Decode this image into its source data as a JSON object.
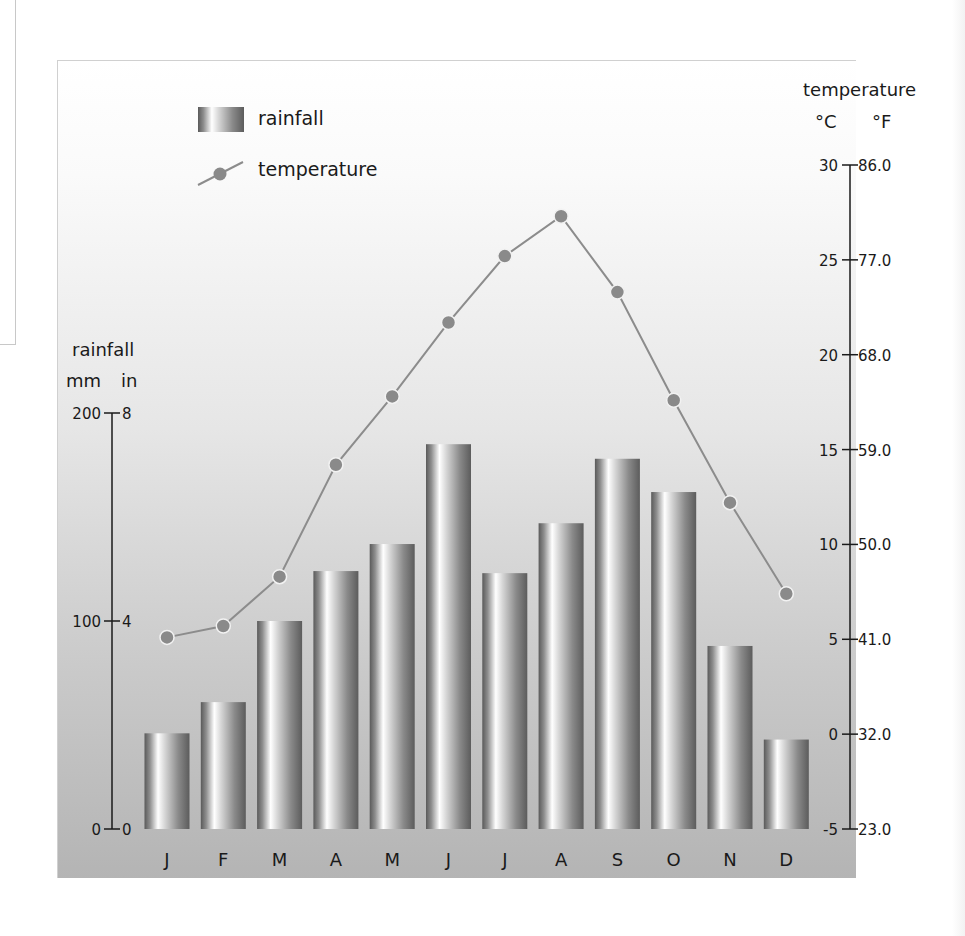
{
  "chart_data": {
    "type": "bar+line",
    "title": "",
    "legend": [
      {
        "name": "rainfall",
        "marker": "bar"
      },
      {
        "name": "temperature",
        "marker": "line-dot"
      }
    ],
    "legend_position": "top-left",
    "categories": [
      "J",
      "F",
      "M",
      "A",
      "M",
      "J",
      "J",
      "A",
      "S",
      "O",
      "N",
      "D"
    ],
    "series": [
      {
        "name": "rainfall",
        "type": "bar",
        "unit": "mm",
        "axis": "left",
        "values": [
          46,
          61,
          100,
          124,
          137,
          185,
          123,
          147,
          178,
          162,
          88,
          43
        ]
      },
      {
        "name": "temperature",
        "type": "line",
        "unit": "°C",
        "axis": "right",
        "values": [
          5.1,
          5.7,
          8.3,
          14.2,
          17.8,
          21.7,
          25.2,
          27.3,
          23.3,
          17.6,
          12.2,
          7.4
        ]
      }
    ],
    "left_axis": {
      "title": "rainfall",
      "unit_labels": [
        "mm",
        "in"
      ],
      "ylim": [
        0,
        200
      ],
      "ticks": [
        {
          "mm": "200",
          "in": "8",
          "value": 200
        },
        {
          "mm": "100",
          "in": "4",
          "value": 100
        },
        {
          "mm": "0",
          "in": "0",
          "value": 0
        }
      ]
    },
    "right_axis": {
      "title": "temperature",
      "unit_labels": [
        "°C",
        "°F"
      ],
      "ylim": [
        -5,
        30
      ],
      "ticks": [
        {
          "c": "30",
          "f": "86.0",
          "value": 30
        },
        {
          "c": "25",
          "f": "77.0",
          "value": 25
        },
        {
          "c": "20",
          "f": "68.0",
          "value": 20
        },
        {
          "c": "15",
          "f": "59.0",
          "value": 15
        },
        {
          "c": "10",
          "f": "50.0",
          "value": 10
        },
        {
          "c": "5",
          "f": "41.0",
          "value": 5
        },
        {
          "c": "0",
          "f": "32.0",
          "value": 0
        },
        {
          "c": "-5",
          "f": "23.0",
          "value": -5
        }
      ]
    },
    "xlabel": "",
    "grid": false
  },
  "colors": {
    "line": "#8c8c8c",
    "marker_fill": "#8a8a8a",
    "marker_stroke": "#f2f2f2",
    "axis": "#1a1a1a"
  }
}
